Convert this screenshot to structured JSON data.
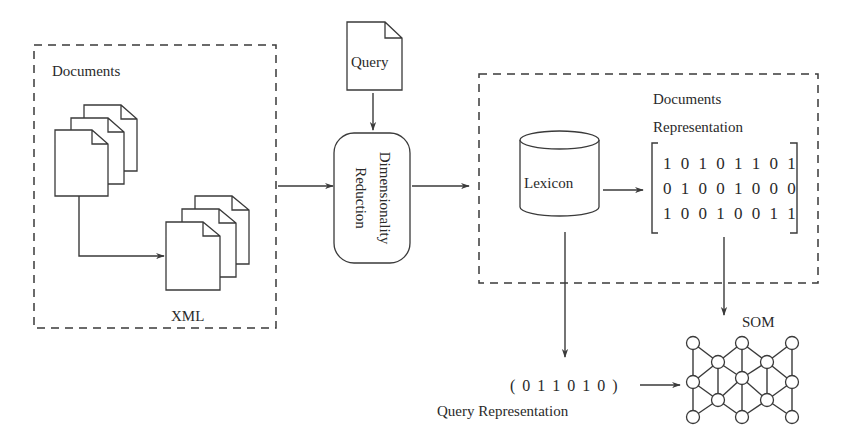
{
  "diagram": {
    "documents_group": {
      "title": "Documents",
      "xml_label": "XML"
    },
    "query_doc": {
      "label": "Query"
    },
    "dim_reduction": {
      "line1": "Dimensionality",
      "line2": "Reduction"
    },
    "representation_group": {
      "lexicon_label": "Lexicon",
      "doc_rep_title_line1": "Documents",
      "doc_rep_title_line2": "Representation",
      "matrix_rows": [
        "1 0 1 0 1 1 0 1",
        "0 1 0 0 1 0 0 0",
        "1 0 0 1 0 0 1 1"
      ]
    },
    "query_representation": {
      "vector": "( 0 1 1 0 1 0 )",
      "label": "Query Representation"
    },
    "som": {
      "label": "SOM"
    }
  }
}
